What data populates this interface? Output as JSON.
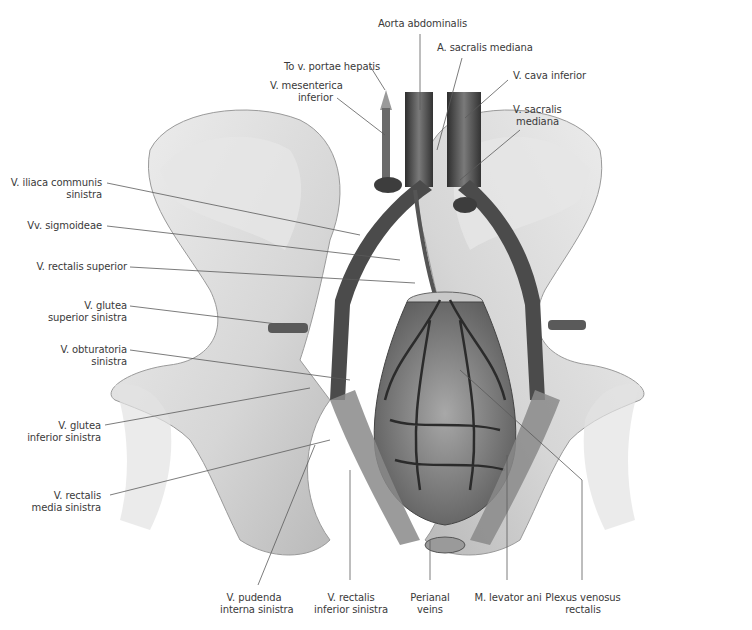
{
  "figure": {
    "colors": {
      "background": "#ffffff",
      "label_text": "#3a3a3a",
      "leader_line": "#555555",
      "bone": "#d9d9d9",
      "vessel": "#555555"
    }
  },
  "labels": {
    "top": [
      {
        "id": "aorta",
        "text": "Aorta abdominalis"
      },
      {
        "id": "a_sacralis",
        "text": "A. sacralis mediana"
      },
      {
        "id": "portae",
        "text": "To v. portae hepatis"
      },
      {
        "id": "mesenterica_l1",
        "text": "V. mesenterica"
      },
      {
        "id": "mesenterica_l2",
        "text": "inferior"
      },
      {
        "id": "cava",
        "text": "V. cava inferior"
      },
      {
        "id": "v_sacralis_l1",
        "text": "V. sacralis"
      },
      {
        "id": "v_sacralis_l2",
        "text": "mediana"
      }
    ],
    "left": [
      {
        "id": "iliaca_l1",
        "text": "V. iliaca communis"
      },
      {
        "id": "iliaca_l2",
        "text": "sinistra"
      },
      {
        "id": "sigmoideae",
        "text": "Vv. sigmoideae"
      },
      {
        "id": "rectalis_sup",
        "text": "V. rectalis superior"
      },
      {
        "id": "glutea_sup_l1",
        "text": "V. glutea"
      },
      {
        "id": "glutea_sup_l2",
        "text": "superior sinistra"
      },
      {
        "id": "obturatoria_l1",
        "text": "V. obturatoria"
      },
      {
        "id": "obturatoria_l2",
        "text": "sinistra"
      },
      {
        "id": "glutea_inf_l1",
        "text": "V. glutea"
      },
      {
        "id": "glutea_inf_l2",
        "text": "inferior sinistra"
      },
      {
        "id": "rectalis_media_l1",
        "text": "V. rectalis"
      },
      {
        "id": "rectalis_media_l2",
        "text": "media sinistra"
      }
    ],
    "bottom": [
      {
        "id": "pudenda_l1",
        "text": "V. pudenda"
      },
      {
        "id": "pudenda_l2",
        "text": "interna sinistra"
      },
      {
        "id": "rectalis_inf_l1",
        "text": "V. rectalis"
      },
      {
        "id": "rectalis_inf_l2",
        "text": "inferior sinistra"
      },
      {
        "id": "perianal_l1",
        "text": "Perianal"
      },
      {
        "id": "perianal_l2",
        "text": "veins"
      },
      {
        "id": "levator",
        "text": "M. levator ani"
      },
      {
        "id": "plexus_l1",
        "text": "Plexus venosus"
      },
      {
        "id": "plexus_l2",
        "text": "rectalis"
      }
    ]
  }
}
